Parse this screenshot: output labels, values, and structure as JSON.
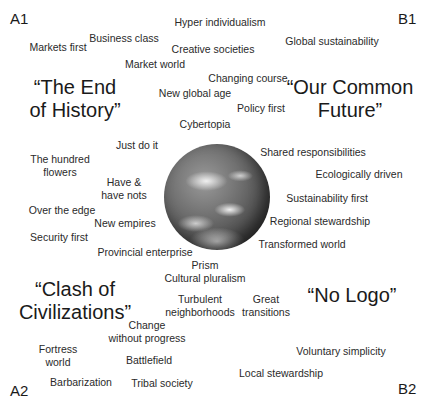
{
  "corners": {
    "a1": "A1",
    "b1": "B1",
    "a2": "A2",
    "b2": "B2"
  },
  "quadrant_titles": {
    "a1": [
      "“The End",
      "of History”"
    ],
    "b1": [
      "“Our Common",
      "Future”"
    ],
    "a2": [
      "“Clash of",
      "Civilizations”"
    ],
    "b2": [
      "“No Logo”"
    ]
  },
  "center_image": "earth-globe",
  "scenarios": [
    {
      "text": "Hyper individualism"
    },
    {
      "text": "Markets first"
    },
    {
      "text": "Business class"
    },
    {
      "text": "Creative societies"
    },
    {
      "text": "Global sustainability"
    },
    {
      "text": "Market world"
    },
    {
      "text": "Changing course"
    },
    {
      "text": "New global age"
    },
    {
      "text": "Policy first"
    },
    {
      "text": "Cybertopia"
    },
    {
      "text": "Just do it"
    },
    {
      "text": "Shared responsibilities"
    },
    {
      "text": "The hundred flowers",
      "lines": [
        "The hundred",
        "flowers"
      ]
    },
    {
      "text": "Ecologically driven"
    },
    {
      "text": "Have & have nots",
      "lines": [
        "Have &",
        "have nots"
      ]
    },
    {
      "text": "Sustainability first"
    },
    {
      "text": "Over the edge"
    },
    {
      "text": "Regional stewardship"
    },
    {
      "text": "New empires"
    },
    {
      "text": "Security first"
    },
    {
      "text": "Transformed world"
    },
    {
      "text": "Provincial enterprise"
    },
    {
      "text": "Prism"
    },
    {
      "text": "Cultural pluralism"
    },
    {
      "text": "Turbulent neighborhoods",
      "lines": [
        "Turbulent",
        "neighborhoods"
      ]
    },
    {
      "text": "Great transitions",
      "lines": [
        "Great",
        "transitions"
      ]
    },
    {
      "text": "Change without progress",
      "lines": [
        "Change",
        "without progress"
      ]
    },
    {
      "text": "Fortress world",
      "lines": [
        "Fortress",
        "world"
      ]
    },
    {
      "text": "Battlefield"
    },
    {
      "text": "Voluntary simplicity"
    },
    {
      "text": "Local stewardship"
    },
    {
      "text": "Barbarization"
    },
    {
      "text": "Tribal society"
    }
  ]
}
